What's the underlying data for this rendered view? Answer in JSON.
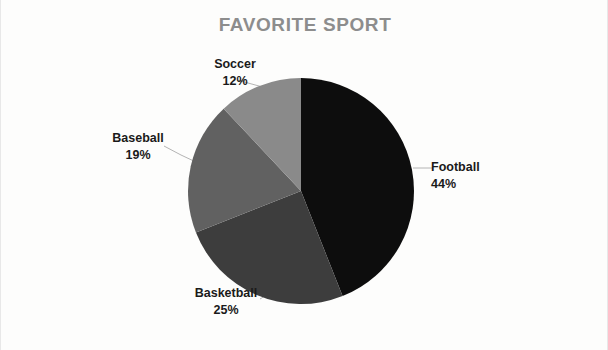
{
  "chart_data": {
    "type": "pie",
    "title": "FAVORITE SPORT",
    "categories": [
      "Football",
      "Basketball",
      "Baseball",
      "Soccer"
    ],
    "values": [
      44,
      25,
      19,
      12
    ],
    "value_unit": "%",
    "labels": [
      {
        "name": "Football",
        "percent": "44%",
        "value": 44,
        "color": "#0d0d0d"
      },
      {
        "name": "Basketball",
        "percent": "25%",
        "value": 25,
        "color": "#3d3d3d"
      },
      {
        "name": "Baseball",
        "percent": "19%",
        "value": 19,
        "color": "#616161"
      },
      {
        "name": "Soccer",
        "percent": "12%",
        "value": 12,
        "color": "#8a8a8a"
      }
    ],
    "start_angle_deg": 0,
    "direction": "clockwise",
    "legend": "none",
    "grid": false,
    "label_position": "outside-with-leader-lines",
    "title_color": "#8d8d8d",
    "label_color": "#1a1a1a",
    "leader_line_color": "#b4b4b4",
    "background_color": "#fdfdfc",
    "center": {
      "x": 300,
      "y": 191
    },
    "radius": 113
  },
  "page": {
    "width": 608,
    "height": 350
  }
}
